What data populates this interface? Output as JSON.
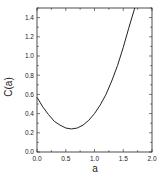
{
  "chart_data": {
    "type": "line",
    "title": "",
    "xlabel": "a",
    "ylabel": "C(a)",
    "xlim": [
      0.0,
      2.0
    ],
    "ylim": [
      0.0,
      1.5
    ],
    "xticks": [
      "0.0",
      "0.5",
      "1.0",
      "1.5",
      "2.0"
    ],
    "yticks": [
      "0.0",
      "0.2",
      "0.4",
      "0.6",
      "0.8",
      "1.0",
      "1.2",
      "1.4"
    ],
    "grid": false,
    "legend": null,
    "series": [
      {
        "name": "C(a)",
        "x": [
          0.0,
          0.1,
          0.2,
          0.3,
          0.4,
          0.5,
          0.6,
          0.7,
          0.8,
          0.9,
          1.0,
          1.1,
          1.2,
          1.3,
          1.4,
          1.5,
          1.6,
          1.7
        ],
        "y": [
          0.57,
          0.47,
          0.39,
          0.32,
          0.28,
          0.25,
          0.24,
          0.25,
          0.28,
          0.33,
          0.4,
          0.49,
          0.6,
          0.74,
          0.9,
          1.09,
          1.3,
          1.5
        ]
      }
    ]
  }
}
